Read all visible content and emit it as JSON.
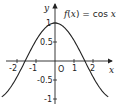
{
  "chart_data": {
    "type": "line",
    "title": "f(x) = cos x",
    "title_parts": {
      "f": "f",
      "open": "(",
      "x": "x",
      "close": ")",
      "eq": " = cos ",
      "x2": "x"
    },
    "xlabel": "x",
    "ylabel": "y",
    "origin_label": "O",
    "function": "cos(x)",
    "xlim": [
      -2.8,
      2.8
    ],
    "ylim": [
      -1.1,
      1.1
    ],
    "x_ticks": [
      -2,
      -1,
      1,
      2
    ],
    "x_tick_labels": [
      "-2",
      "-1",
      "1",
      "2"
    ],
    "y_ticks": [
      1,
      0.5,
      -0.5,
      -1
    ],
    "y_tick_labels": [
      "1",
      "0.5",
      "-0.5",
      "-1"
    ],
    "grid": false,
    "series": [
      {
        "name": "f(x) = cos x",
        "x": [
          -2.8,
          -2,
          -1.5708,
          -1,
          -0.5,
          0,
          0.5,
          1,
          1.5708,
          2,
          2.8
        ],
        "y": [
          -0.942,
          -0.416,
          0,
          0.54,
          0.878,
          1,
          0.878,
          0.54,
          0,
          -0.416,
          -0.942
        ]
      }
    ]
  },
  "colors": {
    "curve": "#222222",
    "axes": "#222222",
    "background": "#ffffff"
  }
}
